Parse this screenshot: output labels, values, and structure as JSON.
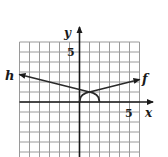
{
  "chart_data": {
    "type": "line",
    "title": "",
    "xlabel": "x",
    "ylabel": "y",
    "x_tick_labels": [
      {
        "value": 5,
        "label": "5"
      }
    ],
    "y_tick_labels": [
      {
        "value": 5,
        "label": "5"
      }
    ],
    "xlim": [
      -6,
      6
    ],
    "ylim": [
      -5.5,
      6
    ],
    "grid": true,
    "grid_step": 1,
    "legend": "none",
    "series": [
      {
        "name": "f",
        "label": "f",
        "description": "starts at origin, rises through (1,1), arrow continues right",
        "points": [
          [
            0,
            0
          ],
          [
            0.1,
            0.45
          ],
          [
            0.3,
            0.7
          ],
          [
            0.6,
            0.88
          ],
          [
            1,
            1
          ],
          [
            2,
            1.25
          ],
          [
            3,
            1.5
          ],
          [
            4,
            1.75
          ],
          [
            5,
            2
          ],
          [
            6,
            2.25
          ]
        ],
        "arrow_end": true
      },
      {
        "name": "h",
        "label": "h",
        "description": "reflection of f across x=1: starts at (2,0), rises through (1,1), arrow continues left",
        "points": [
          [
            2,
            0
          ],
          [
            1.9,
            0.45
          ],
          [
            1.7,
            0.7
          ],
          [
            1.4,
            0.88
          ],
          [
            1,
            1
          ],
          [
            0,
            1.25
          ],
          [
            -1,
            1.5
          ],
          [
            -2,
            1.75
          ],
          [
            -3,
            2
          ],
          [
            -4,
            2.25
          ],
          [
            -6,
            2.75
          ]
        ],
        "arrow_end": true
      }
    ]
  },
  "labels": {
    "x_axis": "x",
    "y_axis": "y",
    "x_tick": "5",
    "y_tick": "5",
    "f_label": "f",
    "h_label": "h"
  },
  "colors": {
    "grid": "#9a9a9a",
    "axis": "#1a1a1a",
    "curve": "#2a2a2a"
  }
}
